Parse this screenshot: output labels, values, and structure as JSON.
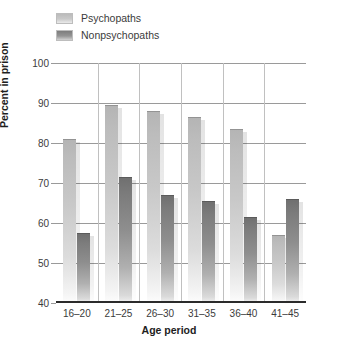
{
  "chart_data": {
    "type": "bar",
    "title": "",
    "xlabel": "Age period",
    "ylabel": "Percent in prison",
    "categories": [
      "16–20",
      "21–25",
      "26–30",
      "31–35",
      "36–40",
      "41–45"
    ],
    "series": [
      {
        "name": "Psychopaths",
        "values": [
          81,
          89.5,
          88,
          86.5,
          83.5,
          57
        ]
      },
      {
        "name": "Nonpsychopaths",
        "values": [
          57.5,
          71.5,
          67,
          65.5,
          61.5,
          66
        ]
      }
    ],
    "ylim": [
      40,
      100
    ],
    "yticks": [
      40,
      50,
      60,
      70,
      80,
      90,
      100
    ],
    "ytick_labels": [
      "40",
      "50",
      "60",
      "70",
      "80",
      "90",
      "100"
    ],
    "grid": true,
    "legend_position": "top-left",
    "colors": {
      "psychopaths": "#c8c8c8",
      "nonpsychopaths": "#8e8e8e",
      "gridline": "#9a9a9a",
      "axis": "#2b2b2b",
      "text": "#3b3b3b"
    }
  },
  "legend": {
    "items": [
      {
        "label": "Psychopaths",
        "swatch": "psychopaths-swatch"
      },
      {
        "label": "Nonpsychopaths",
        "swatch": "nonpsychopaths-swatch"
      }
    ]
  },
  "axes": {
    "y_title": "Percent in prison",
    "x_title": "Age period",
    "y_ticks": [
      "100",
      "90",
      "80",
      "70",
      "60",
      "50",
      "40"
    ],
    "x_ticks": [
      "16–20",
      "21–25",
      "26–30",
      "31–35",
      "36–40",
      "41–45"
    ]
  }
}
